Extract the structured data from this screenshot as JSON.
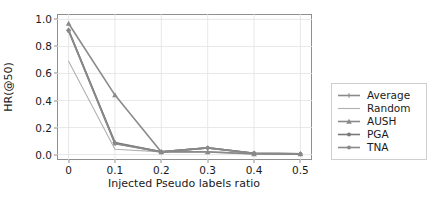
{
  "chart_data": {
    "type": "line",
    "title": "",
    "xlabel": "Injected Pseudo labels ratio",
    "ylabel": "HR(@50)",
    "x": [
      0,
      0.1,
      0.2,
      0.3,
      0.4,
      0.5
    ],
    "xticklabels": [
      "0",
      "0.1",
      "0.2",
      "0.3",
      "0.4",
      "0.5"
    ],
    "yticklabels": [
      "0.0",
      "0.2",
      "0.4",
      "0.6",
      "0.8",
      "1.0"
    ],
    "yticks": [
      0.0,
      0.2,
      0.4,
      0.6,
      0.8,
      1.0
    ],
    "xlim": [
      -0.025,
      0.525
    ],
    "ylim": [
      -0.04,
      1.04
    ],
    "grid": true,
    "legend_position": "right outside",
    "series": [
      {
        "name": "Average",
        "marker": "plus",
        "color": "#8a8a8a",
        "values": [
          0.92,
          0.09,
          0.02,
          0.05,
          0.01,
          0.005
        ]
      },
      {
        "name": "Random",
        "marker": "none",
        "color": "#b0b0b0",
        "values": [
          0.69,
          0.04,
          0.02,
          0.02,
          0.005,
          0.005
        ]
      },
      {
        "name": "AUSH",
        "marker": "triangle",
        "color": "#8a8a8a",
        "values": [
          0.97,
          0.44,
          0.02,
          0.02,
          0.005,
          0.005
        ]
      },
      {
        "name": "PGA",
        "marker": "circle",
        "color": "#787878",
        "values": [
          0.92,
          0.085,
          0.02,
          0.05,
          0.01,
          0.005
        ]
      },
      {
        "name": "TNA",
        "marker": "circle",
        "color": "#8a8a8a",
        "values": [
          0.915,
          0.08,
          0.02,
          0.05,
          0.01,
          0.005
        ]
      }
    ]
  }
}
